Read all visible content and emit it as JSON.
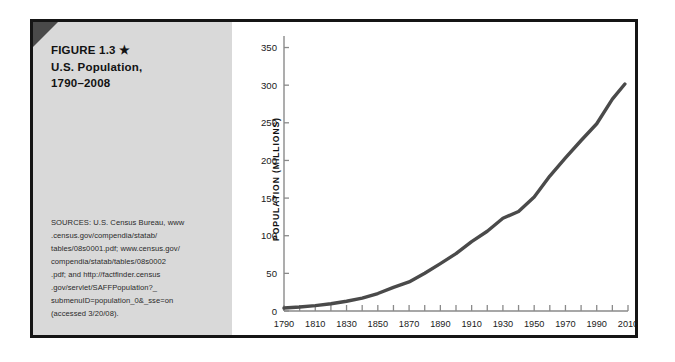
{
  "figure": {
    "title_lines": [
      "FIGURE 1.3 ★",
      "U.S. Population,",
      "1790–2008"
    ],
    "sources_lines": [
      "SOURCES: U.S. Census Bureau, www",
      ".census.gov/compendia/statab/",
      "tables/08s0001.pdf; www.census.gov/",
      "compendia/statab/tables/08s0002",
      ".pdf; and http://factfinder.census",
      ".gov/servlet/SAFFPopulation?_",
      "submenuID=population_0&_sse=on",
      "(accessed 3/20/08)."
    ],
    "colors": {
      "panel_bg": "#d9d9d9",
      "frame": "#151515",
      "corner_fold": "#4a4a4a",
      "line": "#4a4a4a"
    }
  },
  "chart_data": {
    "type": "line",
    "xlabel": "",
    "ylabel": "POPULATION (MILLIONS)",
    "xlim": [
      1790,
      2010
    ],
    "ylim": [
      0,
      360
    ],
    "grid": false,
    "legend": "none",
    "y_ticks": [
      0,
      50,
      100,
      150,
      200,
      250,
      300,
      350
    ],
    "y_tick_labels": [
      "0",
      "50",
      "100",
      "150",
      "200",
      "250",
      "300",
      "350"
    ],
    "x_ticks": [
      1790,
      1800,
      1810,
      1820,
      1830,
      1840,
      1850,
      1860,
      1870,
      1880,
      1890,
      1900,
      1910,
      1920,
      1930,
      1940,
      1950,
      1960,
      1970,
      1980,
      1990,
      2000,
      2010
    ],
    "x_tick_labels": [
      "1790",
      "",
      "1810",
      "",
      "1830",
      "",
      "1850",
      "",
      "1870",
      "",
      "1890",
      "",
      "1910",
      "",
      "1930",
      "",
      "1950",
      "",
      "1970",
      "",
      "1990",
      "",
      "2010"
    ],
    "x": [
      1790,
      1800,
      1810,
      1820,
      1830,
      1840,
      1850,
      1860,
      1870,
      1880,
      1890,
      1900,
      1910,
      1920,
      1930,
      1940,
      1950,
      1960,
      1970,
      1980,
      1990,
      2000,
      2008
    ],
    "values": [
      3.9,
      5.3,
      7.2,
      9.6,
      12.9,
      17.1,
      23.2,
      31.4,
      38.6,
      50.2,
      62.9,
      76.2,
      92.2,
      106.0,
      123.2,
      132.2,
      151.3,
      179.3,
      203.3,
      226.5,
      248.7,
      281.4,
      301.6
    ],
    "series": [
      {
        "name": "U.S. Population (millions)",
        "values": [
          3.9,
          5.3,
          7.2,
          9.6,
          12.9,
          17.1,
          23.2,
          31.4,
          38.6,
          50.2,
          62.9,
          76.2,
          92.2,
          106.0,
          123.2,
          132.2,
          151.3,
          179.3,
          203.3,
          226.5,
          248.7,
          281.4,
          301.6
        ]
      }
    ]
  }
}
